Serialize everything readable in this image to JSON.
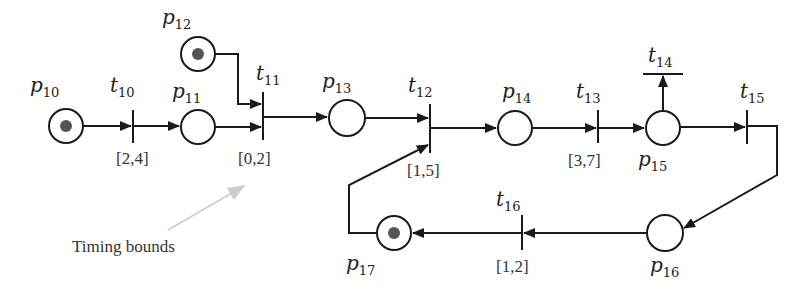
{
  "diagram": {
    "colors": {
      "line": "#1a1a1a",
      "token": "#555555",
      "note_arrow": "#cccccc",
      "text": "#222222"
    },
    "places": [
      {
        "id": "p10",
        "base": "p",
        "sub": "10",
        "cx": 66,
        "cy": 126,
        "r": 17,
        "token": true,
        "label_x": 30,
        "label_y": 92
      },
      {
        "id": "p11",
        "base": "p",
        "sub": "11",
        "cx": 198,
        "cy": 127,
        "r": 17,
        "token": false,
        "label_x": 172,
        "label_y": 98
      },
      {
        "id": "p12",
        "base": "p",
        "sub": "12",
        "cx": 198,
        "cy": 54,
        "r": 17,
        "token": true,
        "label_x": 162,
        "label_y": 24
      },
      {
        "id": "p13",
        "base": "p",
        "sub": "13",
        "cx": 347,
        "cy": 118,
        "r": 18,
        "token": false,
        "label_x": 322,
        "label_y": 88
      },
      {
        "id": "p14",
        "base": "p",
        "sub": "14",
        "cx": 515,
        "cy": 128,
        "r": 17,
        "token": false,
        "label_x": 502,
        "label_y": 98
      },
      {
        "id": "p15",
        "base": "p",
        "sub": "15",
        "cx": 663,
        "cy": 128,
        "r": 17,
        "token": false,
        "label_x": 638,
        "label_y": 166
      },
      {
        "id": "p16",
        "base": "p",
        "sub": "16",
        "cx": 665,
        "cy": 233,
        "r": 18,
        "token": false,
        "label_x": 650,
        "label_y": 272
      },
      {
        "id": "p17",
        "base": "p",
        "sub": "17",
        "cx": 394,
        "cy": 233,
        "r": 17,
        "token": true,
        "label_x": 346,
        "label_y": 270
      }
    ],
    "transitions": [
      {
        "id": "t10",
        "base": "t",
        "sub": "10",
        "orient": "v",
        "x": 133,
        "y1": 110,
        "y2": 143,
        "label_x": 110,
        "label_y": 92,
        "bound": "[2,4]",
        "bound_x": 116,
        "bound_y": 164
      },
      {
        "id": "t11",
        "base": "t",
        "sub": "11",
        "orient": "v",
        "x": 263,
        "y1": 92,
        "y2": 140,
        "label_x": 256,
        "label_y": 80,
        "bound": "[0,2]",
        "bound_x": 238,
        "bound_y": 164
      },
      {
        "id": "t12",
        "base": "t",
        "sub": "12",
        "orient": "v",
        "x": 430,
        "y1": 104,
        "y2": 153,
        "label_x": 408,
        "label_y": 92,
        "bound": "[1,5]",
        "bound_x": 407,
        "bound_y": 176
      },
      {
        "id": "t13",
        "base": "t",
        "sub": "13",
        "orient": "v",
        "x": 598,
        "y1": 110,
        "y2": 143,
        "label_x": 576,
        "label_y": 98,
        "bound": "[3,7]",
        "bound_x": 568,
        "bound_y": 166
      },
      {
        "id": "t14",
        "base": "t",
        "sub": "14",
        "orient": "h",
        "y": 74,
        "x1": 643,
        "x2": 683,
        "label_x": 648,
        "label_y": 62,
        "bound": "",
        "bound_x": 0,
        "bound_y": 0
      },
      {
        "id": "t15",
        "base": "t",
        "sub": "15",
        "orient": "v",
        "x": 747,
        "y1": 110,
        "y2": 144,
        "label_x": 740,
        "label_y": 98,
        "bound": "",
        "bound_x": 0,
        "bound_y": 0
      },
      {
        "id": "t16",
        "base": "t",
        "sub": "16",
        "orient": "v",
        "x": 522,
        "y1": 215,
        "y2": 250,
        "label_x": 496,
        "label_y": 206,
        "bound": "[1,2]",
        "bound_x": 496,
        "bound_y": 272
      }
    ],
    "arcs": [
      {
        "from": "p10",
        "to": "t10",
        "points": "83,126 131,126"
      },
      {
        "from": "t10",
        "to": "p11",
        "points": "133,126 179,126"
      },
      {
        "from": "p11",
        "to": "t11",
        "points": "215,127 261,127"
      },
      {
        "from": "p12",
        "to": "t11",
        "points": "215,54 238,54 238,104 261,104"
      },
      {
        "from": "t11",
        "to": "p13",
        "points": "263,117 327,117"
      },
      {
        "from": "p13",
        "to": "t12",
        "points": "365,118 428,118"
      },
      {
        "from": "t12",
        "to": "p14",
        "points": "430,128 496,128"
      },
      {
        "from": "p14",
        "to": "t13",
        "points": "532,128 596,128"
      },
      {
        "from": "t13",
        "to": "p15",
        "points": "598,128 644,128"
      },
      {
        "from": "p15",
        "to": "t14",
        "points": "663,111 663,76"
      },
      {
        "from": "p15",
        "to": "t15",
        "points": "680,127 745,127"
      },
      {
        "from": "t15",
        "to": "p16",
        "points": "747,126 777,126 777,175 684,228"
      },
      {
        "from": "p16",
        "to": "t16",
        "points": "647,233 524,233"
      },
      {
        "from": "t16",
        "to": "p17",
        "points": "522,233 413,233"
      },
      {
        "from": "p17",
        "to": "t12",
        "points": "377,233 349,233 349,185 428,145"
      }
    ],
    "annotation": {
      "text": "Timing bounds",
      "text_x": 72,
      "text_y": 252,
      "arrow": {
        "x1": 168,
        "y1": 230,
        "x2": 244,
        "y2": 186
      }
    }
  }
}
